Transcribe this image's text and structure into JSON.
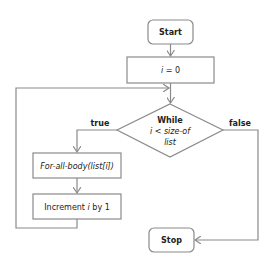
{
  "diagram": {
    "type": "flowchart",
    "nodes": {
      "start": {
        "label": "Start"
      },
      "init": {
        "label_var": "i",
        "label_rest": " = 0"
      },
      "decision": {
        "line1": "While",
        "line2": "i < size-of",
        "line3": "list"
      },
      "body": {
        "label": "For-all-body(list[i])"
      },
      "increment": {
        "label_pre": "Increment ",
        "label_var": "i",
        "label_post": " by 1"
      },
      "stop": {
        "label": "Stop"
      }
    },
    "edges": {
      "true_label": "true",
      "false_label": "false"
    },
    "colors": {
      "stroke": "#8a8a8a",
      "text": "#222222",
      "fill": "#ffffff"
    }
  }
}
